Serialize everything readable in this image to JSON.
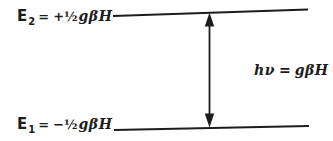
{
  "colors": {
    "ink": "#1c1c1c",
    "background": "#ffffff"
  },
  "levels": {
    "upper": {
      "symbol": "E",
      "subscript": "2",
      "relation": "=",
      "coefficient": "+½",
      "expression": "gβH"
    },
    "lower": {
      "symbol": "E",
      "subscript": "1",
      "relation": "=",
      "coefficient": "−½",
      "expression": "gβH"
    }
  },
  "transition": {
    "planck": "h",
    "frequency": "ν",
    "relation": "=",
    "expression": "gβH"
  }
}
